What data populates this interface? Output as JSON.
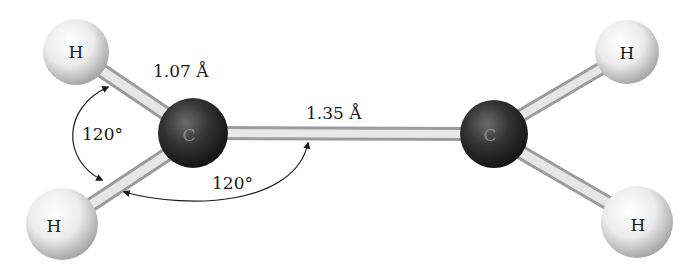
{
  "molecule": {
    "name": "ethylene",
    "atoms": [
      {
        "id": "H1",
        "symbol": "H",
        "x": 76,
        "y": 52,
        "r": 33,
        "type": "hydrogen"
      },
      {
        "id": "H2",
        "symbol": "H",
        "x": 62,
        "y": 224,
        "r": 36,
        "type": "hydrogen"
      },
      {
        "id": "C1",
        "symbol": "C",
        "x": 193,
        "y": 133,
        "r": 35,
        "type": "carbon"
      },
      {
        "id": "C2",
        "symbol": "C",
        "x": 494,
        "y": 134,
        "r": 34,
        "type": "carbon"
      },
      {
        "id": "H3",
        "symbol": "H",
        "x": 627,
        "y": 52,
        "r": 32,
        "type": "hydrogen"
      },
      {
        "id": "H4",
        "symbol": "H",
        "x": 637,
        "y": 222,
        "r": 36,
        "type": "hydrogen"
      }
    ],
    "bonds": [
      {
        "from": "H1",
        "to": "C1"
      },
      {
        "from": "H2",
        "to": "C1"
      },
      {
        "from": "C1",
        "to": "C2"
      },
      {
        "from": "C2",
        "to": "H3"
      },
      {
        "from": "C2",
        "to": "H4"
      }
    ]
  },
  "annotations": {
    "ch_bond_length": "1.07 Å",
    "cc_bond_length": "1.35 Å",
    "hch_angle": "120°",
    "hcc_angle": "120°"
  },
  "colors": {
    "carbon": "#2a2a2a",
    "hydrogen": "#f2f2f2",
    "bond": "#d8d8d8",
    "text": "#1a1a1a"
  }
}
